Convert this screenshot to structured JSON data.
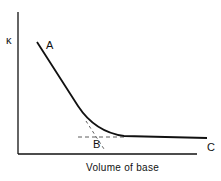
{
  "diagram": {
    "y_axis_label": "κ",
    "x_axis_label": "Volume of base",
    "points": {
      "A": "A",
      "B": "B",
      "C": "C"
    },
    "colors": {
      "line": "#111111",
      "background": "#ffffff"
    }
  }
}
